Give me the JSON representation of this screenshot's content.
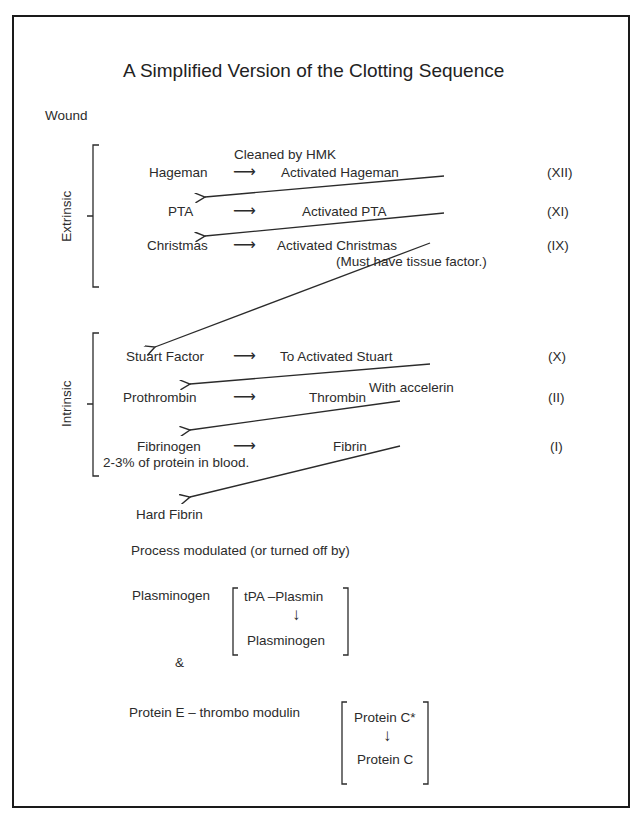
{
  "title": "A Simplified Version of the Clotting Sequence",
  "start_label": "Wound",
  "groups": {
    "extrinsic": "Extrinsic",
    "intrinsic": "Intrinsic"
  },
  "steps": [
    {
      "from": "Hageman",
      "to": "Activated Hageman",
      "factor": "(XII)",
      "note": "Cleaned by HMK"
    },
    {
      "from": "PTA",
      "to": "Activated PTA",
      "factor": "(XI)"
    },
    {
      "from": "Christmas",
      "to": "Activated Christmas",
      "factor": "(IX)",
      "note": "(Must have tissue factor.)"
    },
    {
      "from": "Stuart Factor",
      "to": "To Activated Stuart",
      "factor": "(X)"
    },
    {
      "from": "Prothrombin",
      "to": "Thrombin",
      "factor": "(II)",
      "note": "With accelerin"
    },
    {
      "from": "Fibrinogen",
      "to": "Fibrin",
      "factor": "(I)",
      "note": "2-3% of protein in blood."
    }
  ],
  "arrow_glyph": "⟶",
  "down_arrow_glyph": "↓",
  "final_product": "Hard Fibrin",
  "modulation": {
    "heading": "Process modulated (or turned off by)",
    "plasminogen": {
      "label": "Plasminogen",
      "top": "tPA –Plasmin",
      "bottom": "Plasminogen"
    },
    "ampersand": "&",
    "protein": {
      "label": "Protein E – thrombo modulin",
      "top": "Protein C*",
      "bottom": "Protein C"
    }
  },
  "colors": {
    "ink": "#2b2b2b",
    "border": "#1a1a1a",
    "background": "#ffffff"
  }
}
